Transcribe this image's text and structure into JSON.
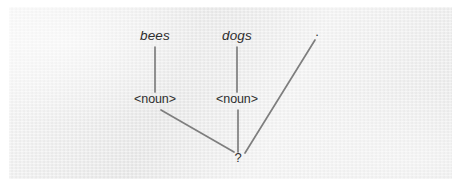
{
  "figure": {
    "kind": "syntax-parse-tree",
    "caption": "",
    "paper_color": "#eeeeee",
    "ink_color": "#2e2e2e",
    "line_color": "#7e7e7e",
    "nodes": [
      {
        "id": "w-bees",
        "label": "bees",
        "style": "italic",
        "x": 155,
        "y": 40,
        "role": "word-token"
      },
      {
        "id": "w-dogs",
        "label": "dogs",
        "style": "italic",
        "x": 237,
        "y": 40,
        "role": "word-token"
      },
      {
        "id": "w-dot",
        "label": ".",
        "style": "roman",
        "x": 317,
        "y": 36,
        "role": "punctuation-token"
      },
      {
        "id": "t-noun1",
        "label": "<noun>",
        "style": "roman",
        "x": 155,
        "y": 103,
        "role": "pos-tag"
      },
      {
        "id": "t-noun2",
        "label": "<noun>",
        "style": "roman",
        "x": 237,
        "y": 103,
        "role": "pos-tag"
      },
      {
        "id": "r-root",
        "label": "?",
        "style": "roman",
        "x": 238,
        "y": 162,
        "role": "unknown-root"
      }
    ],
    "edges": [
      {
        "id": "e-bees-noun1",
        "from": "w-bees",
        "to": "t-noun1",
        "x1": 155,
        "y1": 47,
        "x2": 155,
        "y2": 92
      },
      {
        "id": "e-dogs-noun2",
        "from": "w-dogs",
        "to": "t-noun2",
        "x1": 237,
        "y1": 47,
        "x2": 237,
        "y2": 92
      },
      {
        "id": "e-noun1-root",
        "from": "t-noun1",
        "to": "r-root",
        "x1": 161,
        "y1": 110,
        "x2": 234,
        "y2": 152
      },
      {
        "id": "e-noun2-root",
        "from": "t-noun2",
        "to": "r-root",
        "x1": 238,
        "y1": 110,
        "x2": 238,
        "y2": 152
      },
      {
        "id": "e-dot-root",
        "from": "w-dot",
        "to": "r-root",
        "x1": 315,
        "y1": 40,
        "x2": 245,
        "y2": 153
      }
    ]
  }
}
